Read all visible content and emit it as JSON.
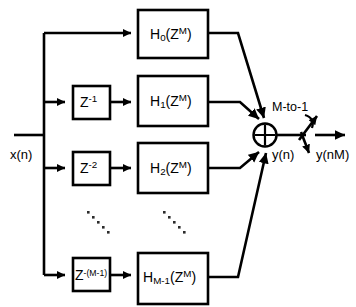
{
  "diagram": {
    "input_label": "x(n)",
    "sum_output_label": "y(n)",
    "output_label": "y(nM)",
    "switch_label": "M-to-1",
    "colors": {
      "line": "#000000",
      "background": "#ffffff",
      "box_fill": "#ffffff",
      "dots": "#2b2b2b"
    },
    "delays": [
      {
        "name": "delay-0",
        "present": false,
        "base": "",
        "exponent": ""
      },
      {
        "name": "delay-1",
        "present": true,
        "base": "Z",
        "exponent": "-1"
      },
      {
        "name": "delay-2",
        "present": true,
        "base": "Z",
        "exponent": "-2"
      },
      {
        "name": "delay-m1",
        "present": true,
        "base": "Z",
        "exponent": "-(M-1)"
      }
    ],
    "filters": [
      {
        "name": "filter-h0",
        "base": "H",
        "subscript": "0",
        "arg_open": "(Z",
        "arg_sup": "M",
        "arg_close": ")"
      },
      {
        "name": "filter-h1",
        "base": "H",
        "subscript": "1",
        "arg_open": "(Z",
        "arg_sup": "M",
        "arg_close": ")"
      },
      {
        "name": "filter-h2",
        "base": "H",
        "subscript": "2",
        "arg_open": "(Z",
        "arg_sup": "M",
        "arg_close": ")"
      },
      {
        "name": "filter-hm1",
        "base": "H",
        "subscript": "M-1",
        "arg_open": "(Z",
        "arg_sup": "M",
        "arg_close": ")"
      }
    ],
    "ellipsis": {
      "left_dots": 5,
      "right_dots": 5
    },
    "summer_symbol": "plus-circle"
  }
}
